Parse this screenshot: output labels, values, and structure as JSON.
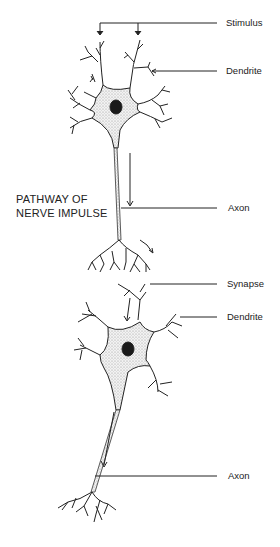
{
  "diagram": {
    "title_line1": "PATHWAY OF",
    "title_line2": "NERVE IMPULSE",
    "labels": {
      "stimulus": "Stimulus",
      "dendrite_top": "Dendrite",
      "axon_top": "Axon",
      "synapse": "Synapse",
      "dendrite_bottom": "Dendrite",
      "axon_bottom": "Axon"
    }
  }
}
